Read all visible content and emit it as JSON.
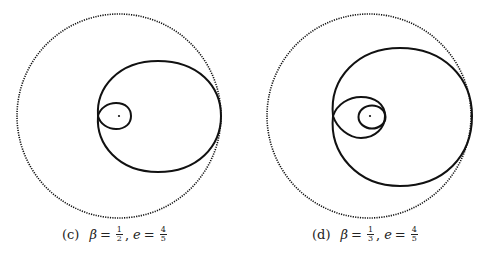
{
  "figure": {
    "panels": [
      {
        "id": "c",
        "caption": {
          "tag": "(c)",
          "beta_symbol": "β",
          "equals": "=",
          "beta_num": "1",
          "beta_den": "2",
          "sep": ",",
          "e_symbol": "e",
          "e_num": "4",
          "e_den": "5"
        },
        "elements": [
          "dotted bounding circle",
          "outer solid loop",
          "inner solid loop",
          "center point"
        ]
      },
      {
        "id": "d",
        "caption": {
          "tag": "(d)",
          "beta_symbol": "β",
          "equals": "=",
          "beta_num": "1",
          "beta_den": "3",
          "sep": ",",
          "e_symbol": "e",
          "e_num": "4",
          "e_den": "5"
        },
        "elements": [
          "dotted bounding circle",
          "outer solid loop",
          "middle solid loop",
          "inner solid loop",
          "center point"
        ]
      }
    ],
    "colors": {
      "stroke": "#111111",
      "background": "#ffffff"
    }
  }
}
